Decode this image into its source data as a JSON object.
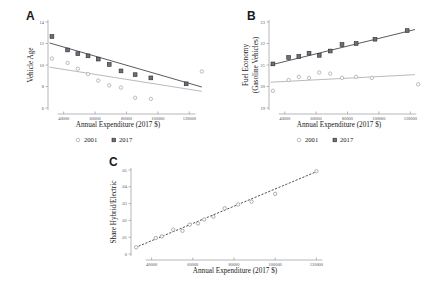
{
  "figure": {
    "panels": [
      {
        "letter": "A",
        "ylabel": "Vehicle Age",
        "xlabel": "Annual Expenditure (2017 $)"
      },
      {
        "letter": "B",
        "ylabel_line1": "Fuel Economy",
        "ylabel_line2": "(Gasoline Vehicles)",
        "xlabel": "Annual Expenditure (2017 $)"
      },
      {
        "letter": "C",
        "ylabel": "Share Hybrid/Electric",
        "xlabel": "Annual Expenditure (2017 $)"
      }
    ],
    "legend": {
      "series_2001": "2001",
      "series_2017": "2017",
      "marker_2001": "open-circle",
      "marker_2017": "filled-square"
    },
    "colors": {
      "series_2017": "#6e6e77",
      "series_2001": "#ffffff",
      "fit_2017": "#3c3c42",
      "fit_2001": "#a8a8ae",
      "axis": "#9a9a9f",
      "text": "#1a1a1a"
    }
  },
  "chart_data": [
    {
      "type": "scatter",
      "panel": "A",
      "title": "",
      "xlabel": "Annual Expenditure (2017 $)",
      "ylabel": "Vehicle Age",
      "xlim": [
        30000,
        130000
      ],
      "ylim": [
        6,
        14
      ],
      "xticks": [
        40000,
        60000,
        80000,
        100000,
        120000
      ],
      "xticklabels": [
        "40000",
        "60000",
        "80000",
        "100000",
        "120000"
      ],
      "yticks": [
        6,
        8,
        10,
        12,
        14
      ],
      "yticklabels": [
        "6",
        "8",
        "10",
        "12",
        "14"
      ],
      "grid": false,
      "legend_position": "below",
      "series": [
        {
          "name": "2017",
          "marker": "filled-square",
          "x": [
            32500,
            42500,
            49000,
            55500,
            62000,
            69000,
            76500,
            85500,
            95500,
            118000
          ],
          "y": [
            12.65,
            11.4,
            11.05,
            10.85,
            10.55,
            10.05,
            9.45,
            9.1,
            8.8,
            8.25
          ],
          "fit_line": {
            "x": [
              31000,
              128000
            ],
            "y": [
              12.05,
              7.95
            ]
          }
        },
        {
          "name": "2001",
          "marker": "open-circle",
          "x": [
            32500,
            42500,
            49000,
            55500,
            62000,
            69000,
            76500,
            85500,
            95500,
            128000
          ],
          "y": [
            10.6,
            10.2,
            9.65,
            9.15,
            8.55,
            8.1,
            7.9,
            6.95,
            6.85,
            9.4
          ],
          "fit_line": {
            "x": [
              31000,
              128000
            ],
            "y": [
              9.8,
              7.55
            ]
          }
        }
      ]
    },
    {
      "type": "scatter",
      "panel": "B",
      "title": "",
      "xlabel": "Annual Expenditure (2017 $)",
      "ylabel": "Fuel Economy (Gasoline Vehicles)",
      "xlim": [
        30000,
        130000
      ],
      "ylim": [
        19,
        23
      ],
      "xticks": [
        40000,
        60000,
        80000,
        100000,
        120000
      ],
      "xticklabels": [
        "40000",
        "60000",
        "80000",
        "100000",
        "120000"
      ],
      "yticks": [
        19,
        20,
        21,
        22,
        23
      ],
      "yticklabels": [
        "19",
        "20",
        "21",
        "22",
        "23"
      ],
      "grid": false,
      "legend_position": "below",
      "series": [
        {
          "name": "2017",
          "marker": "filled-square",
          "x": [
            32500,
            42500,
            49000,
            55500,
            62000,
            69000,
            76500,
            85500,
            97500,
            118000
          ],
          "y": [
            21.05,
            21.35,
            21.4,
            21.55,
            21.45,
            21.65,
            21.95,
            22.0,
            22.2,
            22.6
          ],
          "fit_line": {
            "x": [
              31000,
              123000
            ],
            "y": [
              21.0,
              22.65
            ]
          }
        },
        {
          "name": "2001",
          "marker": "open-circle",
          "x": [
            32500,
            42500,
            49000,
            55500,
            62000,
            69000,
            76500,
            85500,
            95500,
            125000
          ],
          "y": [
            19.8,
            20.3,
            20.45,
            20.4,
            20.65,
            20.6,
            20.4,
            20.45,
            20.4,
            20.1
          ],
          "fit_line": {
            "x": [
              31000,
              123000
            ],
            "y": [
              20.2,
              20.55
            ]
          }
        }
      ]
    },
    {
      "type": "scatter",
      "panel": "C",
      "title": "",
      "xlabel": "Annual Expenditure (2017 $)",
      "ylabel": "Share Hybrid/Electric",
      "xlim": [
        30000,
        130000
      ],
      "ylim": [
        0,
        0.05
      ],
      "xticks": [
        40000,
        60000,
        80000,
        100000,
        120000
      ],
      "xticklabels": [
        "40000",
        "60000",
        "80000",
        "100000",
        "120000"
      ],
      "yticks": [
        0,
        0.01,
        0.02,
        0.03,
        0.04,
        0.05
      ],
      "yticklabels": [
        "0",
        ".01",
        ".02",
        ".03",
        ".04",
        ".05"
      ],
      "grid": false,
      "legend_position": "none",
      "series": [
        {
          "name": "share-hybrid-electric",
          "marker": "open-circle",
          "x": [
            32500,
            42000,
            45000,
            50500,
            55000,
            58500,
            62500,
            65500,
            70000,
            75500,
            82000,
            88500,
            100000,
            120000
          ],
          "y": [
            0.004,
            0.0095,
            0.0105,
            0.0145,
            0.0138,
            0.0175,
            0.0182,
            0.0205,
            0.0222,
            0.0272,
            0.0295,
            0.0312,
            0.0358,
            0.0492
          ],
          "fit_line": {
            "x": [
              32000,
              121000
            ],
            "y": [
              0.0038,
              0.0495
            ]
          }
        }
      ]
    }
  ]
}
